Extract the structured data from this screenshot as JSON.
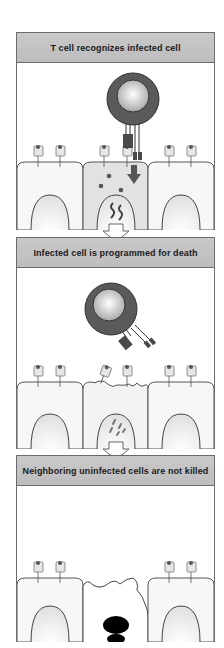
{
  "figure": {
    "panels": [
      {
        "title": "T cell recognizes infected cell",
        "state": "recognition",
        "elements": [
          "T cell",
          "T cell receptor bound to MHC-peptide on infected cell",
          "co-receptor",
          "cytotoxic granules released into infected cell",
          "viral particles in nucleus",
          "two uninfected neighboring cells"
        ]
      },
      {
        "title": "Infected cell is programmed for death",
        "state": "apoptosis-induction",
        "elements": [
          "T cell detached and tilted",
          "infected cell membrane blebbing",
          "fragmented viral material in nucleus",
          "two uninfected neighboring cells"
        ]
      },
      {
        "title": "Neighboring uninfected cells are not killed",
        "state": "outcome",
        "elements": [
          "dead infected cell with condensed black nucleus",
          "two intact uninfected neighboring cells"
        ]
      }
    ],
    "colors": {
      "header_bg": "#c4c4c4",
      "border": "#6b6b6b",
      "tcell_outer": "#5a5a5a",
      "tcell_inner": "#d9d9d9",
      "cell_fill": "#f5f5f5",
      "infected_cell_fill": "#e3e3e3",
      "granule": "#555555",
      "dead_nucleus": "#000000"
    }
  }
}
